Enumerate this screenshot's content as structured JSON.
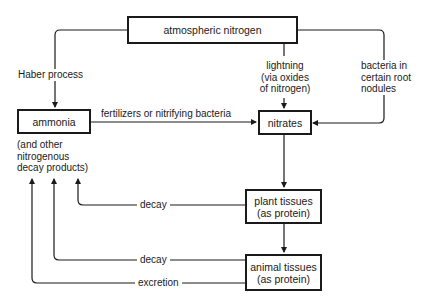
{
  "diagram": {
    "nodes": {
      "atmospheric_nitrogen": "atmospheric nitrogen",
      "ammonia": "ammonia",
      "ammonia_note": "(and other\nnitrogenous\ndecay products)",
      "nitrates": "nitrates",
      "plant_tissues": "plant tissues\n(as protein)",
      "animal_tissues": "animal tissues\n(as protein)"
    },
    "edges": {
      "haber": "Haber process",
      "lightning": "lightning\n(via oxides\nof nitrogen)",
      "root_bacteria": "bacteria in\ncertain root\nnodules",
      "fertilizers": "fertilizers or nitrifying bacteria",
      "plant_decay": "decay",
      "animal_decay": "decay",
      "excretion": "excretion"
    },
    "colors": {
      "line": "#1a1a1a",
      "background": "#ffffff"
    }
  }
}
